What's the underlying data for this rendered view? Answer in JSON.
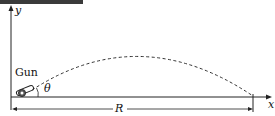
{
  "diagram": {
    "labels": {
      "y_axis": "y",
      "x_axis": "x",
      "gun": "Gun",
      "angle": "θ",
      "range": "R"
    },
    "colors": {
      "line": "#222222",
      "header_bar": "#3a3a3a",
      "background": "#ffffff"
    }
  }
}
